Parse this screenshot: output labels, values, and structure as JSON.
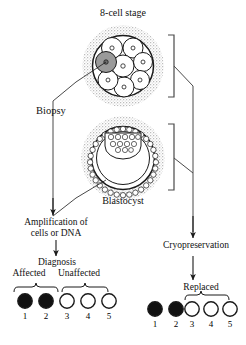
{
  "figure": {
    "title_text": "8-cell stage",
    "labels": {
      "eight_cell_stage": "8-cell stage",
      "biopsy": "Biopsy",
      "blastocyst": "Blastocyst",
      "amplification_line1": "Amplification of",
      "amplification_line2": "cells or DNA",
      "diagnosis": "Diagnosis",
      "affected": "Affected",
      "unaffected": "Unaffected",
      "cryopreservation": "Cryopreservation",
      "replaced": "Replaced"
    },
    "colors": {
      "line": "#1a1a1a",
      "zona_stipple": "#b9b9b9",
      "cell_fill": "#ffffff",
      "biopsied_cell_fill": "#9a9a9a",
      "affected_embryo_fill": "#111111",
      "unaffected_embryo_fill": "#ffffff",
      "text": "#111111"
    },
    "embryos": {
      "eight_cell": {
        "label": "8-cell stage",
        "cell_count": 8,
        "biopsied_cell_index": 3,
        "has_zona_pellucida": true
      },
      "blastocyst": {
        "label": "Blastocyst",
        "has_zona_pellucida": true,
        "has_inner_cell_mass": true,
        "trophectoderm_cell_count": 28
      }
    },
    "diagnosis_row": {
      "name": "diagnosis-embryo-row",
      "group_labels": [
        {
          "label": "Affected",
          "members": [
            "1",
            "2"
          ]
        },
        {
          "label": "Unaffected",
          "members": [
            "3",
            "4",
            "5"
          ]
        }
      ],
      "items": [
        {
          "number": "1",
          "state": "affected"
        },
        {
          "number": "2",
          "state": "affected"
        },
        {
          "number": "3",
          "state": "unaffected"
        },
        {
          "number": "4",
          "state": "unaffected"
        },
        {
          "number": "5",
          "state": "unaffected"
        }
      ]
    },
    "replaced_row": {
      "name": "replaced-embryo-row",
      "group_labels": [
        {
          "label": "Replaced",
          "members": [
            "3",
            "4",
            "5"
          ]
        }
      ],
      "items": [
        {
          "number": "1",
          "state": "affected"
        },
        {
          "number": "2",
          "state": "affected"
        },
        {
          "number": "3",
          "state": "unaffected"
        },
        {
          "number": "4",
          "state": "unaffected"
        },
        {
          "number": "5",
          "state": "unaffected"
        }
      ]
    },
    "flow": {
      "left_branch": [
        "Biopsy",
        "Amplification of cells or DNA",
        "Diagnosis"
      ],
      "right_branch": [
        "Cryopreservation",
        "Replaced"
      ]
    }
  }
}
